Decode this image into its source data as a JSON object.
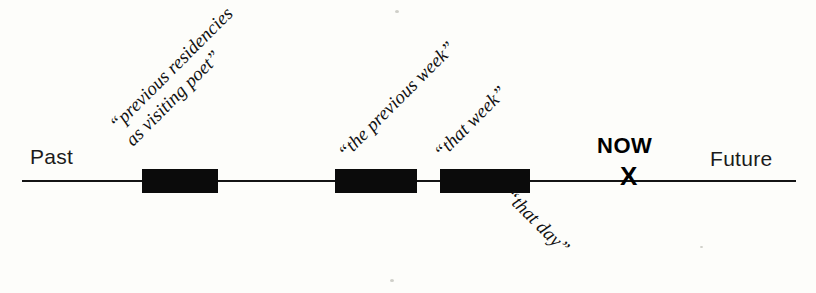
{
  "diagram": {
    "type": "timeline",
    "background_color": "#fdfdfa",
    "ink_color": "#0b0b0b",
    "axis": {
      "left_label": "Past",
      "right_label": "Future",
      "now_label": "NOW",
      "now_marker": "X"
    },
    "intervals": [
      {
        "name": "previous-residencies",
        "label_line1": "“previous residencies",
        "label_line2": "as visiting poet”"
      },
      {
        "name": "the-previous-week",
        "label_line1": "“the previous week”"
      },
      {
        "name": "that-week",
        "label_line1": "“that week”"
      }
    ],
    "sublabel": {
      "name": "that-day",
      "label": "“that day”"
    }
  }
}
